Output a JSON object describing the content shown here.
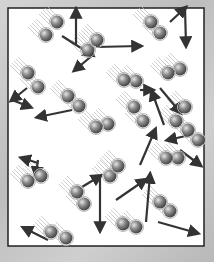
{
  "diagram": {
    "box": {
      "x": 8,
      "y": 8,
      "w": 196,
      "h": 238,
      "border": "#222222",
      "fill": "#ffffff"
    },
    "colors": {
      "molecule": "#7a7a7a",
      "molecule_highlight": "#d8d8d8",
      "arrow": "#333333",
      "motion": "#bbbbbb"
    },
    "molecules": [
      {
        "a": [
          57,
          22
        ],
        "b": [
          46,
          35
        ],
        "arrow": [
          [
            62,
            36
          ],
          [
            92,
            55
          ]
        ],
        "arrow2": [
          [
            76,
            45
          ],
          [
            76,
            10
          ]
        ]
      },
      {
        "a": [
          97,
          40
        ],
        "b": [
          88,
          50
        ],
        "arrow": [
          [
            94,
            54
          ],
          [
            75,
            70
          ]
        ]
      },
      {
        "a": [
          151,
          22
        ],
        "b": [
          160,
          33
        ],
        "arrow": [
          [
            170,
            22
          ],
          [
            185,
            8
          ]
        ],
        "arrow2": [
          [
            185,
            8
          ],
          [
            186,
            45
          ]
        ]
      },
      {
        "a": [
          28,
          73
        ],
        "b": [
          38,
          87
        ],
        "arrow": [
          [
            27,
            88
          ],
          [
            12,
            100
          ]
        ],
        "arrow2": [
          [
            12,
            100
          ],
          [
            30,
            107
          ]
        ]
      },
      {
        "a": [
          68,
          96
        ],
        "b": [
          79,
          106
        ],
        "arrow": [
          [
            72,
            110
          ],
          [
            38,
            117
          ]
        ]
      },
      {
        "a": [
          124,
          80
        ],
        "b": [
          136,
          81
        ],
        "arrow": [
          [
            96,
            47
          ],
          [
            140,
            46
          ]
        ]
      },
      {
        "a": [
          168,
          73
        ],
        "b": [
          180,
          69
        ],
        "arrow": [
          [
            160,
            88
          ],
          [
            180,
            112
          ]
        ]
      },
      {
        "a": [
          134,
          107
        ],
        "b": [
          143,
          121
        ],
        "arrow": [
          [
            140,
            90
          ],
          [
            152,
            90
          ]
        ]
      },
      {
        "a": [
          185,
          107
        ],
        "b": [
          176,
          121
        ],
        "arrow": [
          [
            164,
            125
          ],
          [
            152,
            92
          ]
        ]
      },
      {
        "a": [
          28,
          181
        ],
        "b": [
          41,
          176
        ],
        "arrow": [
          [
            38,
            160
          ],
          [
            36,
            175
          ]
        ],
        "arrow2": [
          [
            38,
            163
          ],
          [
            22,
            158
          ]
        ]
      },
      {
        "a": [
          77,
          192
        ],
        "b": [
          84,
          204
        ],
        "arrow": [
          [
            82,
            187
          ],
          [
            100,
            176
          ]
        ],
        "arrow2": [
          [
            100,
            176
          ],
          [
            100,
            230
          ]
        ]
      },
      {
        "a": [
          51,
          232
        ],
        "b": [
          66,
          238
        ],
        "arrow": [
          [
            48,
            240
          ],
          [
            24,
            228
          ]
        ]
      },
      {
        "a": [
          166,
          158
        ],
        "b": [
          178,
          158
        ],
        "arrow": [
          [
            140,
            165
          ],
          [
            155,
            130
          ]
        ]
      },
      {
        "a": [
          118,
          166
        ],
        "b": [
          110,
          176
        ],
        "arrow": [
          [
            116,
            200
          ],
          [
            145,
            180
          ]
        ]
      },
      {
        "a": [
          160,
          202
        ],
        "b": [
          170,
          211
        ],
        "arrow": [
          [
            158,
            222
          ],
          [
            197,
            233
          ]
        ]
      },
      {
        "a": [
          123,
          224
        ],
        "b": [
          136,
          227
        ],
        "arrow": [
          [
            146,
            222
          ],
          [
            150,
            175
          ]
        ]
      },
      {
        "a": [
          96,
          127
        ],
        "b": [
          108,
          124
        ],
        "arrow": [
          [
            190,
            135
          ],
          [
            168,
            140
          ]
        ]
      },
      {
        "a": [
          188,
          130
        ],
        "b": [
          198,
          140
        ],
        "arrow": [
          [
            180,
            150
          ],
          [
            200,
            165
          ]
        ]
      }
    ]
  }
}
